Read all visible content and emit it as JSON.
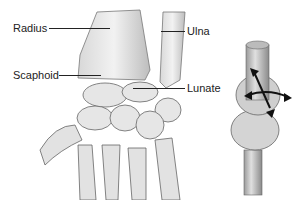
{
  "figure": {
    "labels": {
      "radius": "Radius",
      "ulna": "Ulna",
      "scaphoid": "Scaphoid",
      "lunate": "Lunate"
    },
    "illustrations": [
      "wrist-bones-illustration",
      "ellipsoid-joint-model"
    ]
  }
}
